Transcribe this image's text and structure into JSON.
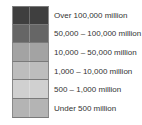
{
  "chart_data": {
    "type": "legend",
    "title": "",
    "legend_entries": [
      {
        "label": "Over 100,000 million",
        "color": "#3f3f3f"
      },
      {
        "label": "50,000 – 100,000 million",
        "color": "#666666"
      },
      {
        "label": "10,000 – 50,000 million",
        "color": "#a3a3a3"
      },
      {
        "label": "1,000 – 10,000 million",
        "color": "#bdbdbd"
      },
      {
        "label": "500 – 1,000 million",
        "color": "#d0d0d0"
      },
      {
        "label": "Under 500 million",
        "color": "#b4b4b4"
      }
    ]
  },
  "legend": {
    "items": [
      {
        "label": "Over 100,000 million",
        "color": "#3f3f3f"
      },
      {
        "label": "50,000 – 100,000 million",
        "color": "#666666"
      },
      {
        "label": "10,000 – 50,000 million",
        "color": "#a3a3a3"
      },
      {
        "label": "1,000 – 10,000 million",
        "color": "#bdbdbd"
      },
      {
        "label": "500 – 1,000 million",
        "color": "#d0d0d0"
      },
      {
        "label": "Under 500 million",
        "color": "#b4b4b4"
      }
    ]
  }
}
